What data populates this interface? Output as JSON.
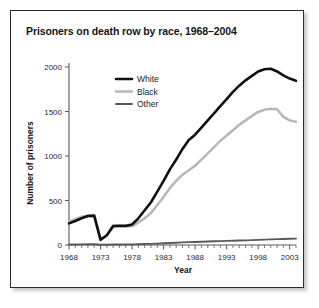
{
  "chart_data": {
    "type": "line",
    "title": "Prisoners on death row by race, 1968–2004",
    "xlabel": "Year",
    "ylabel": "Number of prisoners",
    "xlim": [
      1968,
      2004
    ],
    "ylim": [
      0,
      2000
    ],
    "grid": false,
    "legend_position": "top-left-inside",
    "ytick_labels": [
      "0",
      "500",
      "1000",
      "1500",
      "2000"
    ],
    "ytick_values": [
      0,
      500,
      1000,
      1500,
      2000
    ],
    "xtick_labels": [
      "1968",
      "1973",
      "1978",
      "1983",
      "1988",
      "1993",
      "1998",
      "2003"
    ],
    "xtick_values": [
      1968,
      1973,
      1978,
      1983,
      1988,
      1993,
      1998,
      2003
    ],
    "x": [
      1968,
      1969,
      1970,
      1971,
      1972,
      1973,
      1974,
      1975,
      1976,
      1977,
      1978,
      1979,
      1980,
      1981,
      1982,
      1983,
      1984,
      1985,
      1986,
      1987,
      1988,
      1989,
      1990,
      1991,
      1992,
      1993,
      1994,
      1995,
      1996,
      1997,
      1998,
      1999,
      2000,
      2001,
      2002,
      2003,
      2004
    ],
    "series": [
      {
        "name": "White",
        "color": "#101010",
        "values": [
          243,
          270,
          300,
          325,
          330,
          60,
          110,
          210,
          215,
          215,
          230,
          300,
          390,
          480,
          600,
          720,
          850,
          960,
          1080,
          1180,
          1240,
          1320,
          1400,
          1480,
          1560,
          1640,
          1720,
          1790,
          1850,
          1900,
          1950,
          1975,
          1980,
          1950,
          1905,
          1870,
          1845
        ]
      },
      {
        "name": "Black",
        "color": "#b8b8b8",
        "values": [
          268,
          290,
          318,
          330,
          325,
          55,
          105,
          225,
          215,
          212,
          210,
          255,
          300,
          360,
          450,
          540,
          640,
          720,
          790,
          840,
          890,
          960,
          1030,
          1100,
          1170,
          1230,
          1290,
          1350,
          1400,
          1450,
          1495,
          1520,
          1530,
          1525,
          1440,
          1400,
          1385
        ]
      },
      {
        "name": "Other",
        "color": "#5a5a5a",
        "values": [
          5,
          6,
          7,
          8,
          8,
          2,
          3,
          5,
          6,
          6,
          7,
          9,
          11,
          13,
          16,
          19,
          22,
          26,
          30,
          32,
          34,
          36,
          39,
          42,
          44,
          46,
          48,
          50,
          52,
          55,
          58,
          60,
          63,
          66,
          68,
          70,
          72
        ]
      }
    ]
  },
  "legend": {
    "entries": [
      {
        "label": "White"
      },
      {
        "label": "Black"
      },
      {
        "label": "Other"
      }
    ]
  }
}
